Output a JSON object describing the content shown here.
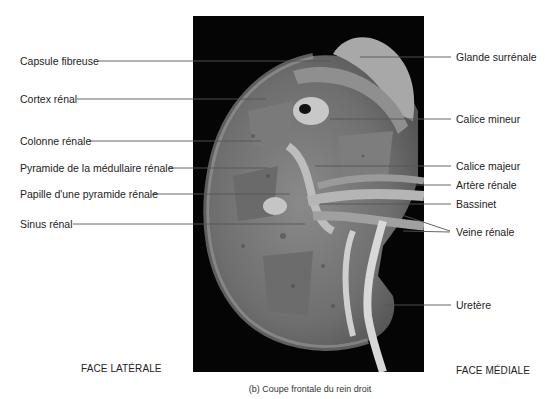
{
  "figure": {
    "caption": "(b) Coupe frontale du rein droit",
    "face_lateral": "FACE LATÉRALE",
    "face_medial": "FACE MÉDIALE"
  },
  "labels_left": [
    {
      "text": "Capsule fibreuse",
      "x": 20,
      "y": 61,
      "line_x1": 98,
      "line_x2": 330
    },
    {
      "text": "Cortex rénal",
      "x": 20,
      "y": 99,
      "line_x1": 77,
      "line_x2": 266
    },
    {
      "text": "Colonne rénale",
      "x": 20,
      "y": 141,
      "line_x1": 89,
      "line_x2": 261
    },
    {
      "text": "Pyramide de la médullaire rénale",
      "x": 20,
      "y": 168,
      "line_x1": 168,
      "line_x2": 268
    },
    {
      "text": "Papille d'une pyramide rénale",
      "x": 20,
      "y": 194,
      "line_x1": 152,
      "line_x2": 290
    },
    {
      "text": "Sinus rénal",
      "x": 20,
      "y": 224,
      "line_x1": 73,
      "line_x2": 305
    }
  ],
  "labels_right": [
    {
      "text": "Glande surrénale",
      "x": 456,
      "y": 57
    },
    {
      "text": "Calice mineur",
      "x": 456,
      "y": 119
    },
    {
      "text": "Calice majeur",
      "x": 456,
      "y": 166
    },
    {
      "text": "Artère rénale",
      "x": 456,
      "y": 185
    },
    {
      "text": "Bassinet",
      "x": 456,
      "y": 204
    },
    {
      "text": "Veine rénale",
      "x": 456,
      "y": 232
    },
    {
      "text": "Uretère",
      "x": 456,
      "y": 305
    }
  ]
}
